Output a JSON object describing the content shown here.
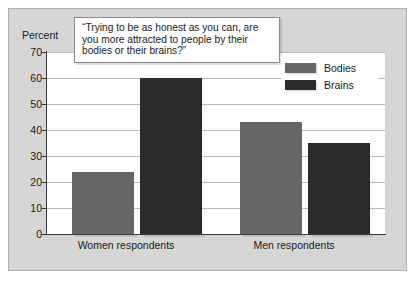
{
  "chart_data": {
    "type": "bar",
    "title": "“Trying to be as honest as you can, are you more attracted to people by their bodies or their brains?”",
    "xlabel": "",
    "ylabel": "Percent",
    "ylim": [
      0,
      70
    ],
    "ytick_step": 10,
    "yticks": [
      "70",
      "60",
      "50",
      "40",
      "30",
      "20",
      "10",
      "0"
    ],
    "grid": true,
    "legend_position": "top-right",
    "categories": [
      "Women respondents",
      "Men respondents"
    ],
    "series": [
      {
        "name": "Bodies",
        "color": "#666666",
        "values": [
          24,
          43
        ]
      },
      {
        "name": "Brains",
        "color": "#2b2b2b",
        "values": [
          60,
          35
        ]
      }
    ]
  },
  "axis": {
    "y_title": "Percent",
    "ticks": [
      {
        "label": "70",
        "value": 70
      },
      {
        "label": "60",
        "value": 60
      },
      {
        "label": "50",
        "value": 50
      },
      {
        "label": "40",
        "value": 40
      },
      {
        "label": "30",
        "value": 30
      },
      {
        "label": "20",
        "value": 20
      },
      {
        "label": "10",
        "value": 10
      },
      {
        "label": "0",
        "value": 0
      }
    ]
  },
  "callout": {
    "text": "“Trying to be as honest as you can, are you more attracted to people by their bodies or their brains?”"
  },
  "legend": {
    "items": [
      {
        "label": "Bodies",
        "color": "#666666"
      },
      {
        "label": "Brains",
        "color": "#2b2b2b"
      }
    ]
  },
  "groups": [
    {
      "label": "Women respondents",
      "bodies": 24,
      "brains": 60
    },
    {
      "label": "Men respondents",
      "bodies": 43,
      "brains": 35
    }
  ],
  "colors": {
    "panel_background": "#d6d6d6",
    "plot_background": "#ffffff",
    "gridline": "#b9b9b9",
    "axis": "#3a3a3a",
    "bodies": "#666666",
    "brains": "#2b2b2b"
  }
}
